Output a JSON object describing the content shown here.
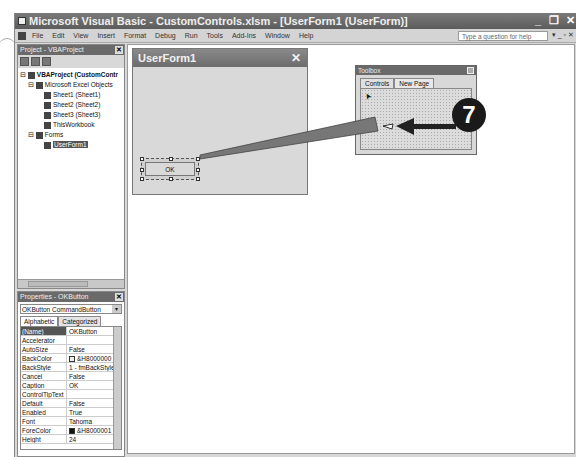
{
  "window": {
    "title": "Microsoft Visual Basic - CustomControls.xlsm - [UserForm1 (UserForm)]",
    "controls": [
      "_",
      "❐",
      "✕"
    ]
  },
  "menu": {
    "items": [
      "File",
      "Edit",
      "View",
      "Insert",
      "Format",
      "Debug",
      "Run",
      "Tools",
      "Add-Ins",
      "Window",
      "Help"
    ],
    "help_placeholder": "Type a question for help",
    "help_controls": "▾ _ ▫ ✕"
  },
  "project": {
    "title": "Project - VBAProject",
    "close": "✕",
    "tree": [
      {
        "label": "VBAProject (CustomContr",
        "level": 0,
        "toggle": "⊟"
      },
      {
        "label": "Microsoft Excel Objects",
        "level": 1,
        "toggle": "⊟"
      },
      {
        "label": "Sheet1 (Sheet1)",
        "level": 2
      },
      {
        "label": "Sheet2 (Sheet2)",
        "level": 2
      },
      {
        "label": "Sheet3 (Sheet3)",
        "level": 2
      },
      {
        "label": "ThisWorkbook",
        "level": 2
      },
      {
        "label": "Forms",
        "level": 1,
        "toggle": "⊟"
      },
      {
        "label": "UserForm1",
        "level": 2,
        "selected": true
      }
    ]
  },
  "properties": {
    "title": "Properties - OKButton",
    "close": "✕",
    "object": "OKButton CommandButton",
    "tabs": [
      "Alphabetic",
      "Categorized"
    ],
    "rows": [
      {
        "k": "(Name)",
        "v": "OKButton"
      },
      {
        "k": "Accelerator",
        "v": ""
      },
      {
        "k": "AutoSize",
        "v": "False"
      },
      {
        "k": "BackColor",
        "v": "&H8000000"
      },
      {
        "k": "BackStyle",
        "v": "1 - fmBackStyle"
      },
      {
        "k": "Cancel",
        "v": "False"
      },
      {
        "k": "Caption",
        "v": "OK"
      },
      {
        "k": "ControlTipText",
        "v": ""
      },
      {
        "k": "Default",
        "v": "False"
      },
      {
        "k": "Enabled",
        "v": "True"
      },
      {
        "k": "Font",
        "v": "Tahoma"
      },
      {
        "k": "ForeColor",
        "v": "&H8000001"
      },
      {
        "k": "Height",
        "v": "24"
      }
    ]
  },
  "userform": {
    "title": "UserForm1",
    "close": "✕",
    "button_caption": "OK"
  },
  "toolbox": {
    "title": "Toolbox",
    "tabs": [
      "Controls",
      "New Page"
    ],
    "pointer": "➤"
  },
  "callout": {
    "number": "7"
  },
  "colors": {
    "titlebar": "#6a6a6a",
    "callout": "#1a1a1a"
  }
}
